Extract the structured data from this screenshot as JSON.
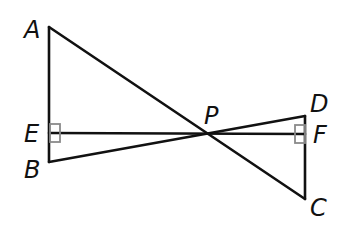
{
  "diagram": {
    "type": "geometry",
    "colors": {
      "line": "#111111",
      "right_angle_marker": "#8a8a8a",
      "background": "#ffffff"
    },
    "points": {
      "A": {
        "label": "A",
        "x": 49,
        "y": 27
      },
      "B": {
        "label": "B",
        "x": 49,
        "y": 162
      },
      "E": {
        "label": "E",
        "x": 49,
        "y": 133
      },
      "P": {
        "label": "P",
        "x": 206,
        "y": 136
      },
      "D": {
        "label": "D",
        "x": 305,
        "y": 116
      },
      "F": {
        "label": "F",
        "x": 305,
        "y": 134
      },
      "C": {
        "label": "C",
        "x": 305,
        "y": 199
      }
    },
    "segments": [
      [
        "A",
        "B"
      ],
      [
        "A",
        "C"
      ],
      [
        "B",
        "D"
      ],
      [
        "D",
        "C"
      ],
      [
        "E",
        "F"
      ]
    ],
    "right_angles": [
      {
        "at": "E",
        "between": [
          "EA",
          "EF"
        ]
      },
      {
        "at": "F",
        "between": [
          "FD",
          "FE"
        ]
      }
    ],
    "labels": [
      {
        "text": "A",
        "x": 24,
        "y": 38
      },
      {
        "text": "E",
        "x": 24,
        "y": 142
      },
      {
        "text": "B",
        "x": 24,
        "y": 178
      },
      {
        "text": "P",
        "x": 204,
        "y": 124
      },
      {
        "text": "D",
        "x": 310,
        "y": 112
      },
      {
        "text": "F",
        "x": 313,
        "y": 143
      },
      {
        "text": "C",
        "x": 310,
        "y": 216
      }
    ]
  }
}
